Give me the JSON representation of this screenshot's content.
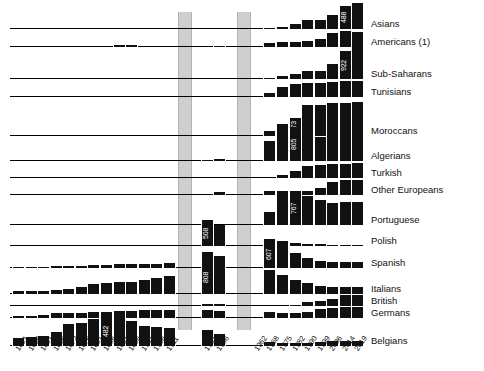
{
  "chart_data": {
    "type": "bar",
    "title": "",
    "subtitle": "",
    "xlabel": "",
    "ylabel": "",
    "grid": false,
    "legend_position": "right",
    "orientation": "vertical",
    "layout": "small-multiples-stacked-rows",
    "note": "Foreign population in France by nationality group, census years 1851-2019. Bars are counts in thousands; selected peak values are labelled in white inside the bar.",
    "gap_bands": [
      {
        "label": "1911-1921 gap (World War I)",
        "start_index": 13,
        "end_index": 14
      },
      {
        "label": "1936-1946 gap (World War II)",
        "start_index": 17,
        "end_index": 18
      }
    ],
    "categories": [
      "1851",
      "1856",
      "1861",
      "1866",
      "1872",
      "1876",
      "1881",
      "1886",
      "1891",
      "1896",
      "1901",
      "1906",
      "1911",
      "1921",
      "1926",
      "1931",
      "1936",
      "1946",
      "1954",
      "1962",
      "1968",
      "1975",
      "1982",
      "1990",
      "1999",
      "2006",
      "2014",
      "2019"
    ],
    "series": [
      {
        "name": "Asians",
        "peak_label": "488",
        "peak_index": 26,
        "values": [
          0,
          0,
          0,
          0,
          0,
          0,
          0,
          0,
          0,
          0,
          0,
          0,
          0,
          0,
          0,
          0,
          0,
          8,
          10,
          12,
          14,
          40,
          95,
          160,
          170,
          260,
          430,
          488
        ]
      },
      {
        "name": "Americans (1)",
        "peak_label": "",
        "peak_index": -1,
        "values": [
          0,
          0,
          0,
          0,
          0,
          0,
          0,
          0,
          10,
          12,
          0,
          0,
          0,
          9,
          0,
          0,
          8,
          10,
          14,
          60,
          25,
          30,
          30,
          38,
          50,
          90,
          105,
          100
        ]
      },
      {
        "name": "Sub-Saharans",
        "peak_label": "922",
        "peak_index": 26,
        "values": [
          0,
          0,
          0,
          0,
          0,
          0,
          0,
          0,
          0,
          0,
          0,
          0,
          0,
          0,
          0,
          0,
          0,
          5,
          6,
          8,
          10,
          90,
          140,
          230,
          230,
          400,
          760,
          922
        ]
      },
      {
        "name": "Tunisians",
        "peak_label": "",
        "peak_index": -1,
        "values": [
          0,
          0,
          0,
          0,
          0,
          0,
          0,
          0,
          0,
          0,
          0,
          0,
          0,
          0,
          0,
          0,
          0,
          4,
          6,
          20,
          60,
          140,
          190,
          200,
          200,
          215,
          230,
          235
        ]
      },
      {
        "name": "Moroccans",
        "peak_label": "573",
        "peak_index": 22,
        "values": [
          0,
          0,
          0,
          0,
          0,
          0,
          0,
          0,
          0,
          0,
          0,
          0,
          0,
          0,
          0,
          0,
          0,
          16,
          20,
          35,
          85,
          220,
          330,
          573,
          570,
          600,
          610,
          620
        ]
      },
      {
        "name": "Algerians",
        "peak_label": "805",
        "peak_index": 22,
        "values": [
          0,
          0,
          0,
          0,
          0,
          0,
          0,
          0,
          0,
          0,
          0,
          0,
          0,
          15,
          22,
          30,
          40,
          22,
          210,
          350,
          470,
          710,
          805,
          620,
          580,
          600,
          640,
          680
        ]
      },
      {
        "name": "Turkish",
        "peak_label": "",
        "peak_index": -1,
        "values": [
          0,
          0,
          0,
          0,
          0,
          0,
          0,
          0,
          0,
          0,
          0,
          0,
          0,
          0,
          0,
          0,
          0,
          0,
          0,
          0,
          0,
          50,
          120,
          200,
          210,
          220,
          230,
          240
        ]
      },
      {
        "name": "Other Europeans",
        "peak_label": "",
        "peak_index": -1,
        "values": [
          0,
          0,
          0,
          0,
          0,
          0,
          0,
          0,
          0,
          0,
          0,
          0,
          0,
          0,
          0,
          0,
          35,
          60,
          60,
          60,
          60,
          60,
          58,
          55,
          100,
          180,
          200,
          200
        ]
      },
      {
        "name": "Portuguese",
        "peak_label": "767",
        "peak_index": 22,
        "values": [
          0,
          0,
          0,
          0,
          0,
          0,
          0,
          0,
          0,
          0,
          0,
          0,
          0,
          0,
          0,
          0,
          0,
          20,
          25,
          50,
          300,
          760,
          767,
          650,
          560,
          490,
          510,
          520
        ]
      },
      {
        "name": "Polish",
        "peak_label": "508",
        "peak_index": 15,
        "values": [
          0,
          0,
          0,
          0,
          0,
          0,
          0,
          0,
          0,
          0,
          0,
          0,
          0,
          45,
          310,
          508,
          420,
          420,
          270,
          180,
          130,
          95,
          65,
          47,
          33,
          25,
          20,
          18
        ]
      },
      {
        "name": "Spanish",
        "peak_label": "607",
        "peak_index": 20,
        "values": [
          28,
          30,
          32,
          34,
          45,
          52,
          60,
          75,
          80,
          85,
          90,
          95,
          105,
          255,
          322,
          352,
          254,
          302,
          289,
          442,
          607,
          497,
          327,
          216,
          161,
          135,
          130,
          125
        ]
      },
      {
        "name": "Italians",
        "peak_label": "808",
        "peak_index": 15,
        "values": [
          63,
          80,
          77,
          100,
          113,
          165,
          240,
          264,
          286,
          291,
          330,
          377,
          419,
          451,
          760,
          808,
          721,
          451,
          508,
          629,
          572,
          463,
          340,
          253,
          201,
          175,
          170,
          165
        ]
      },
      {
        "name": "British",
        "peak_label": "",
        "peak_index": -1,
        "values": [
          0,
          0,
          0,
          0,
          0,
          0,
          0,
          0,
          0,
          0,
          0,
          0,
          0,
          25,
          28,
          30,
          25,
          0,
          0,
          0,
          0,
          0,
          20,
          50,
          75,
          90,
          150,
          150
        ]
      },
      {
        "name": "Germans",
        "peak_label": "",
        "peak_index": -1,
        "values": [
          15,
          18,
          28,
          45,
          40,
          45,
          50,
          55,
          60,
          60,
          65,
          70,
          70,
          75,
          72,
          72,
          58,
          50,
          52,
          50,
          48,
          45,
          44,
          52,
          78,
          90,
          95,
          95
        ]
      },
      {
        "name": "Belgians",
        "peak_label": "482",
        "peak_index": 7,
        "values": [
          128,
          140,
          160,
          233,
          347,
          375,
          432,
          482,
          466,
          396,
          323,
          310,
          287,
          349,
          326,
          254,
          195,
          153,
          107,
          80,
          65,
          56,
          50,
          56,
          66,
          76,
          80,
          80
        ]
      }
    ]
  },
  "axis": {
    "tick_labels": [
      "1851",
      "1856",
      "1861",
      "1866",
      "1872",
      "1876",
      "1881",
      "1886",
      "1891",
      "1896",
      "1901",
      "1906",
      "1911",
      "1921",
      "1926",
      "1931",
      "1936",
      "1946",
      "1954",
      "1962",
      "1968",
      "1975",
      "1982",
      "1990",
      "1999",
      "2006",
      "2014",
      "2019"
    ]
  }
}
